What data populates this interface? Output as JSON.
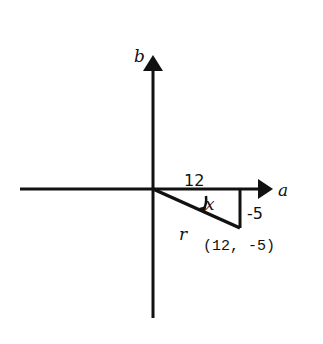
{
  "diagram": {
    "axes": {
      "horizontal_label": "a",
      "vertical_label": "b"
    },
    "triangle": {
      "adjacent_label": "12",
      "opposite_label": "-5",
      "hypotenuse_label": "r",
      "angle_label": "x",
      "point_label": "(12, -5)"
    },
    "colors": {
      "stroke": "#111111",
      "background": "#ffffff"
    }
  }
}
